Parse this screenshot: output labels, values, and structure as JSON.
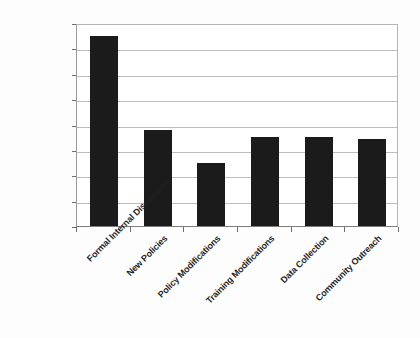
{
  "chart_data": {
    "type": "bar",
    "title": "",
    "subtitle": "",
    "xlabel": "",
    "ylabel": "",
    "categories": [
      "Formal Internal Discussion",
      "New Policies",
      "Policy Modifications",
      "Training Modifications",
      "Data Collection",
      "Community Outreach"
    ],
    "values": [
      37.5,
      19.0,
      12.5,
      17.5,
      17.5,
      17.2
    ],
    "value_labels": [
      "37.5%",
      "19.0%",
      "12.5%",
      "17.5%",
      "17.5%",
      "17.2%"
    ],
    "ylim": [
      0,
      40
    ],
    "ytick_values": [
      0,
      5,
      10,
      15,
      20,
      25,
      30,
      35,
      40
    ],
    "ytick_labels": [
      "0%",
      "5%",
      "10%",
      "15%",
      "20%",
      "25%",
      "30%",
      "35%",
      "40%"
    ],
    "grid": true,
    "legend": false,
    "legend_position": "none",
    "annotations": [],
    "colors": {
      "bar_fill": "#1b1b1b",
      "gridline": "#bdbdbd",
      "axis_line": "#7d7d7d",
      "tick_label": "#161616",
      "category_label": "#1f1f1f",
      "plot_background": "#ffffff",
      "page_background": "#fdfdfd"
    }
  }
}
